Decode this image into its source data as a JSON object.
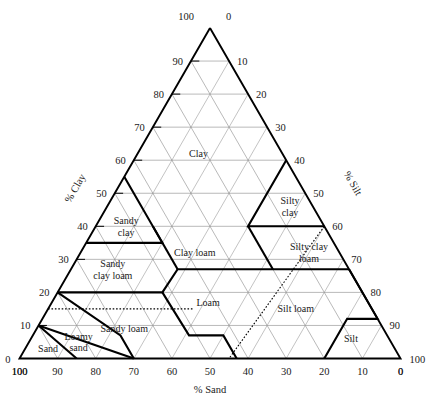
{
  "chart_data": {
    "type": "ternary-diagram",
    "axes": {
      "bottom": {
        "label": "% Sand",
        "direction": "right-to-left",
        "ticks": [
          100,
          90,
          80,
          70,
          60,
          50,
          40,
          30,
          20,
          10,
          0
        ]
      },
      "left": {
        "label": "% Clay",
        "direction": "bottom-to-top",
        "ticks": [
          0,
          10,
          20,
          30,
          40,
          50,
          60,
          70,
          80,
          90,
          100
        ]
      },
      "right": {
        "label": "% Silt",
        "direction": "top-to-bottom",
        "ticks": [
          0,
          10,
          20,
          30,
          40,
          50,
          60,
          70,
          80,
          90,
          100
        ]
      }
    },
    "grid": true,
    "grid_step": 10,
    "corner_labels": {
      "apex_left": "100",
      "apex_right": "0",
      "bottom_left_upper": "0",
      "bottom_left_lower": "100",
      "bottom_right_upper": "100",
      "bottom_right_lower": "0"
    },
    "classes": [
      {
        "name": "Clay",
        "label": "Clay",
        "label_clay": 62,
        "label_sand": 22,
        "lines": [
          [
            [
              40,
              20,
              40
            ],
            [
              40,
              45,
              15
            ]
          ],
          [
            [
              40,
              45,
              15
            ],
            [
              60,
              0,
              40
            ]
          ],
          [
            [
              40,
              20,
              40
            ],
            [
              55,
              0,
              45
            ]
          ]
        ]
      },
      {
        "name": "Silty clay",
        "label": "Silty clay",
        "label_clay": 46,
        "label_sand": 6,
        "lines": [
          [
            [
              40,
              0,
              60
            ],
            [
              40,
              20,
              40
            ]
          ]
        ]
      },
      {
        "name": "Sandy clay",
        "label": "Sandy clay",
        "label_clay": 40,
        "label_sand": 52,
        "lines": [
          [
            [
              35,
              65,
              0
            ],
            [
              35,
              45,
              20
            ]
          ],
          [
            [
              35,
              45,
              20
            ],
            [
              55,
              45,
              0
            ]
          ]
        ]
      },
      {
        "name": "Clay loam",
        "label": "Clay loam",
        "label_clay": 32,
        "label_sand": 38,
        "lines": [
          [
            [
              27,
              45,
              28
            ],
            [
              27,
              20,
              53
            ]
          ],
          [
            [
              27,
              45,
              28
            ],
            [
              40,
              45,
              15
            ]
          ],
          [
            [
              40,
              20,
              40
            ],
            [
              27,
              20,
              53
            ]
          ]
        ]
      },
      {
        "name": "Silty clay loam",
        "label": "Silty clay loam",
        "label_clay": 32,
        "label_sand": 8,
        "lines": [
          [
            [
              27,
              0,
              73
            ],
            [
              27,
              20,
              53
            ]
          ]
        ]
      },
      {
        "name": "Sandy clay loam",
        "label": "Sandy clay loam",
        "label_clay": 27,
        "label_sand": 62,
        "lines": [
          [
            [
              20,
              80,
              0
            ],
            [
              20,
              52.5,
              27.5
            ]
          ],
          [
            [
              20,
              52.5,
              27.5
            ],
            [
              27,
              45,
              28
            ]
          ],
          [
            [
              27,
              52,
              21
            ],
            [
              35,
              65,
              0
            ]
          ]
        ]
      },
      {
        "name": "Loam",
        "label": "Loam",
        "label_clay": 17,
        "label_sand": 42,
        "lines": [
          [
            [
              7,
              52,
              41
            ],
            [
              7,
              43,
              50
            ]
          ],
          [
            [
              7,
              52,
              41
            ],
            [
              20,
              52.5,
              27.5
            ]
          ],
          [
            [
              27,
              20,
              53
            ],
            [
              0,
              45,
              55
            ]
          ]
        ]
      },
      {
        "name": "Silt loam",
        "label": "Silt loam",
        "label_clay": 15,
        "label_sand": 20,
        "lines": [
          [
            [
              12,
              0,
              88
            ],
            [
              12,
              8,
              80
            ]
          ],
          [
            [
              12,
              8,
              80
            ],
            [
              0,
              20,
              80
            ]
          ],
          [
            [
              27,
              0,
              73
            ],
            [
              12,
              0,
              88
            ]
          ]
        ]
      },
      {
        "name": "Silt",
        "label": "Silt",
        "label_clay": 6,
        "label_sand": 10,
        "lines": [
          [
            [
              12,
              0,
              88
            ],
            [
              12,
              8,
              80
            ]
          ],
          [
            [
              12,
              8,
              80
            ],
            [
              0,
              20,
              80
            ]
          ]
        ]
      },
      {
        "name": "Sandy loam",
        "label": "Sandy loam",
        "label_clay": 9,
        "label_sand": 68,
        "lines": [
          [
            [
              20,
              80,
              0
            ],
            [
              7,
              70,
              23
            ]
          ],
          [
            [
              7,
              70,
              23
            ],
            [
              7,
              52,
              41
            ]
          ],
          [
            [
              7,
              43,
              50
            ],
            [
              0,
              43,
              57
            ]
          ]
        ]
      },
      {
        "name": "Loamy sand",
        "label": "Loamy sand",
        "label_clay": 5,
        "label_sand": 82,
        "lines": [
          [
            [
              10,
              90,
              0
            ],
            [
              0,
              70,
              30
            ]
          ]
        ]
      },
      {
        "name": "Sand",
        "label": "Sand",
        "label_clay": 3,
        "label_sand": 91,
        "lines": [
          [
            [
              10,
              90,
              0
            ],
            [
              0,
              85,
              15
            ]
          ]
        ]
      }
    ],
    "boundaries_solid": [
      [
        [
          35,
          65,
          0
        ],
        [
          35,
          45,
          20
        ],
        [
          55,
          45,
          0
        ]
      ],
      [
        [
          40,
          0,
          60
        ],
        [
          40,
          20,
          40
        ],
        [
          60,
          0,
          40
        ]
      ],
      [
        [
          40,
          20,
          40
        ],
        [
          27,
          20,
          53
        ]
      ],
      [
        [
          27,
          0,
          73
        ],
        [
          27,
          20,
          53
        ],
        [
          27,
          45,
          28
        ],
        [
          20,
          52.5,
          27.5
        ],
        [
          20,
          80,
          0
        ]
      ],
      [
        [
          27,
          45,
          28
        ],
        [
          40,
          45,
          15
        ]
      ],
      [
        [
          20,
          52.5,
          27.5
        ],
        [
          7,
          52,
          41
        ],
        [
          7,
          43,
          50
        ],
        [
          0,
          43,
          57
        ]
      ],
      [
        [
          27,
          0,
          73
        ],
        [
          12,
          0,
          88
        ],
        [
          12,
          8,
          80
        ],
        [
          0,
          20,
          80
        ]
      ],
      [
        [
          20,
          80,
          0
        ],
        [
          7,
          70,
          23
        ],
        [
          0,
          70,
          30
        ]
      ],
      [
        [
          10,
          90,
          0
        ],
        [
          0,
          70,
          30
        ]
      ],
      [
        [
          10,
          90,
          0
        ],
        [
          0,
          85,
          15
        ]
      ]
    ],
    "boundaries_dotted": [
      [
        [
          40,
          0,
          60
        ],
        [
          0,
          45,
          55
        ]
      ],
      [
        [
          15,
          85,
          0
        ],
        [
          15,
          47,
          38
        ]
      ]
    ]
  },
  "labels": {
    "axis_sand": "% Sand",
    "axis_clay": "% Clay",
    "axis_silt": "% Silt"
  }
}
